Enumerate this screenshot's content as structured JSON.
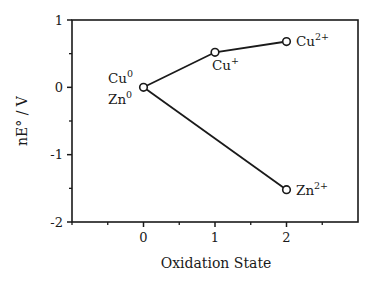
{
  "chart_data": {
    "type": "line",
    "title": "",
    "xlabel": "Oxidation State",
    "ylabel": "nE° / V",
    "xlim": [
      -1,
      3
    ],
    "ylim": [
      -2,
      1
    ],
    "x_ticks": [
      0,
      1,
      2
    ],
    "x_tick_labels": [
      "0",
      "1",
      "2"
    ],
    "x_minor_ticks": [
      -1,
      -0.5,
      0.5,
      1.5,
      2.5
    ],
    "y_ticks": [
      1,
      0,
      -1,
      -2
    ],
    "y_tick_labels": [
      "1",
      "0",
      "-1",
      "-2"
    ],
    "y_minor_ticks": [
      0.5,
      -0.5,
      -1.5
    ],
    "grid": false,
    "legend": "none",
    "series": [
      {
        "name": "Copper",
        "x": [
          0,
          1,
          2
        ],
        "values": [
          0,
          0.52,
          0.68
        ],
        "point_labels": [
          {
            "base": "Cu",
            "sup": "0"
          },
          {
            "base": "Cu",
            "sup": "+"
          },
          {
            "base": "Cu",
            "sup": "2+"
          }
        ]
      },
      {
        "name": "Zinc",
        "x": [
          0,
          2
        ],
        "values": [
          0,
          -1.52
        ],
        "point_labels": [
          {
            "base": "Zn",
            "sup": "0"
          },
          {
            "base": "Zn",
            "sup": "2+"
          }
        ]
      }
    ],
    "colors": {
      "line": "#1a1a1a",
      "marker_fill": "#ffffff",
      "background": "#ffffff"
    }
  }
}
